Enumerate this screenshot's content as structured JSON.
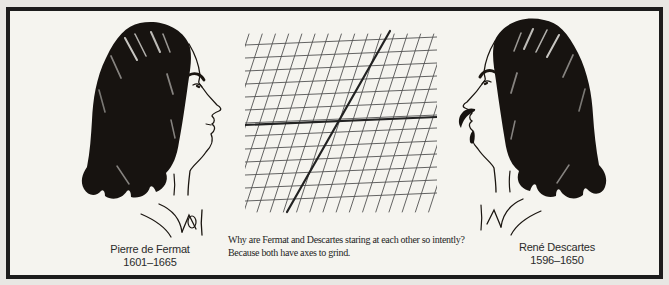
{
  "figure": {
    "left_portrait": {
      "label": "Pierre de Fermat",
      "years": "1601–1665"
    },
    "right_portrait": {
      "label": "René Descartes",
      "years": "1596–1650"
    },
    "caption_line1": "Why are Fermat and Descartes staring at each other so intently?",
    "caption_line2": "Because both have axes to grind.",
    "grid": {
      "x": 245,
      "y": 26,
      "width": 192,
      "height": 188,
      "row_start": 19,
      "row_spacing": 13,
      "row_rise": 8,
      "col_spacing": 13.2,
      "col_lean": 58,
      "line_color": "#525252",
      "line_width": 0.9,
      "axis_color": "#222222",
      "h_axis": {
        "x1": 0,
        "y1": 99,
        "x2": 192,
        "y2": 91
      },
      "o_axis": {
        "x1": 42,
        "y1": 186,
        "x2": 145,
        "y2": 5
      }
    },
    "colors": {
      "paper": "#f5f4ef",
      "margin": "#e8e7e3",
      "frame": "#1c1c1c",
      "ink": "#171310",
      "grid_line": "#525252",
      "grid_axis": "#222222"
    }
  }
}
